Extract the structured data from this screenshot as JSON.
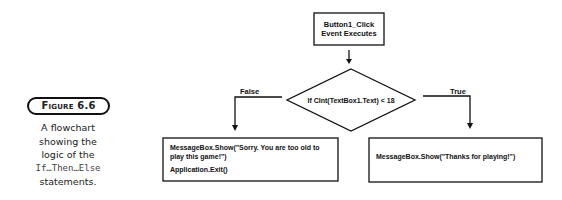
{
  "figure": {
    "label": "Figure 6.6",
    "caption_lines": [
      "A flowchart",
      "showing the",
      "logic of the"
    ],
    "caption_code": "If…Then…Else",
    "caption_end": "statements."
  },
  "flowchart": {
    "start": {
      "line1": "Button1_Click",
      "line2": "Event Executes"
    },
    "decision": "If CInt(TextBox1.Text) < 18",
    "false_label": "False",
    "true_label": "True",
    "false_box": {
      "line1": "MessageBox.Show(\"Sorry. You are too old to",
      "line2": "play this game!\")",
      "line3": "Application.Exit()"
    },
    "true_box": {
      "line1": "MessageBox.Show(\"Thanks for playing!\")"
    }
  }
}
